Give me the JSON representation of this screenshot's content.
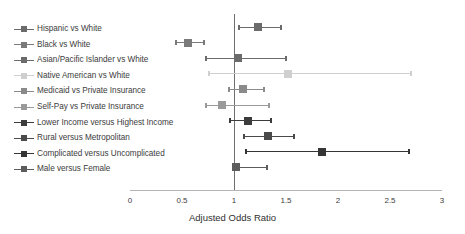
{
  "chart_data": {
    "type": "scatter",
    "subtype": "forest-plot",
    "title": "",
    "xlabel": "Adjusted Odds Ratio",
    "ylabel": "",
    "xlim": [
      0,
      3
    ],
    "xticks": [
      0,
      0.5,
      1,
      1.5,
      2,
      2.5,
      3
    ],
    "xtick_labels": [
      "0",
      "0.5",
      "1",
      "1.5",
      "2",
      "2.5",
      "3"
    ],
    "reference_line": 1,
    "grid": false,
    "legend_position": "left-labels",
    "categories": [
      "Hispanic vs White",
      "Black vs White",
      "Asian/Pacific Islander vs White",
      "Native American vs White",
      "Medicaid vs Private Insurance",
      "Self-Pay vs Private Insurance",
      "Lower Income versus Highest Income",
      "Rural versus Metropolitan",
      "Complicated versus Uncomplicated",
      "Male versus Female"
    ],
    "points": [
      {
        "label": "Hispanic vs White",
        "odds_ratio": 1.23,
        "ci_low": 1.04,
        "ci_high": 1.46,
        "color": "#6b6b6b"
      },
      {
        "label": "Black vs White",
        "odds_ratio": 0.56,
        "ci_low": 0.43,
        "ci_high": 0.72,
        "color": "#7a7a7a"
      },
      {
        "label": "Asian/Pacific Islander vs White",
        "odds_ratio": 1.04,
        "ci_low": 0.72,
        "ci_high": 1.51,
        "color": "#6b6b6b"
      },
      {
        "label": "Native American vs White",
        "odds_ratio": 1.52,
        "ci_low": 0.75,
        "ci_high": 2.71,
        "color": "#cfcfcf"
      },
      {
        "label": "Medicaid vs Private Insurance",
        "odds_ratio": 1.09,
        "ci_low": 0.94,
        "ci_high": 1.3,
        "color": "#8a8a8a"
      },
      {
        "label": "Self-Pay vs Private Insurance",
        "odds_ratio": 0.88,
        "ci_low": 0.72,
        "ci_high": 1.35,
        "color": "#9a9a9a"
      },
      {
        "label": "Lower Income versus Highest Income",
        "odds_ratio": 1.13,
        "ci_low": 0.95,
        "ci_high": 1.37,
        "color": "#3c3c3c"
      },
      {
        "label": "Rural versus Metropolitan",
        "odds_ratio": 1.33,
        "ci_low": 1.09,
        "ci_high": 1.59,
        "color": "#4a4a4a"
      },
      {
        "label": "Complicated versus Uncomplicated",
        "odds_ratio": 1.85,
        "ci_low": 1.11,
        "ci_high": 2.69,
        "color": "#353535"
      },
      {
        "label": "Male versus Female",
        "odds_ratio": 1.02,
        "ci_low": 0.98,
        "ci_high": 1.33,
        "color": "#5c5c5c"
      }
    ]
  },
  "axis": {
    "title": "Adjusted Odds Ratio"
  },
  "colors": {
    "axis": "#b5b5b5",
    "reference_line": "#6e6e6e",
    "text": "#3c3c3c",
    "background": "#ffffff"
  }
}
